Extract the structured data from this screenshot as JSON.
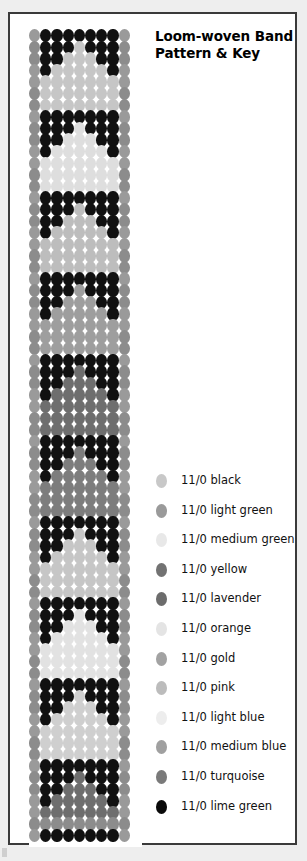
{
  "title": {
    "line1": "Loom-woven Band",
    "line2": "Pattern & Key"
  },
  "palette": {
    "black": "#111111",
    "light_green": "#8c8c8c",
    "medium_green": "#e2e2e2",
    "yellow": "#6e6e6e",
    "lavender": "#707070",
    "orange": "#dedede",
    "gold": "#9a9a9a",
    "pink": "#bdbdbd",
    "light_blue": "#e6e6e6",
    "medium_blue": "#9e9e9e",
    "turquoise": "#7d7d7d",
    "lime_green": "#080808"
  },
  "legend": {
    "entries": [
      {
        "label": "11/0 black",
        "swatch": "#c8c8c8"
      },
      {
        "label": "11/0 light green",
        "swatch": "#9a9a9a"
      },
      {
        "label": "11/0 medium green",
        "swatch": "#e8e8e8"
      },
      {
        "label": "11/0 yellow",
        "swatch": "#727272"
      },
      {
        "label": "11/0 lavender",
        "swatch": "#6c6c6c"
      },
      {
        "label": "11/0 orange",
        "swatch": "#e4e4e4"
      },
      {
        "label": "11/0 gold",
        "swatch": "#a2a2a2"
      },
      {
        "label": "11/0 pink",
        "swatch": "#bcbcbc"
      },
      {
        "label": "11/0 light blue",
        "swatch": "#ededed"
      },
      {
        "label": "11/0 medium blue",
        "swatch": "#a0a0a0"
      },
      {
        "label": "11/0 turquoise",
        "swatch": "#7a7a7a"
      },
      {
        "label": "11/0 lime green",
        "swatch": "#0a0a0a"
      }
    ]
  },
  "pattern": {
    "columns": 9,
    "rows": 70,
    "edge_color": "#9a9a9a",
    "motif_count": 10,
    "grid": [
      [
        "#9a9a9a",
        "#111111",
        "#111111",
        "#111111",
        "#111111",
        "#111111",
        "#111111",
        "#111111",
        "#9a9a9a"
      ],
      [
        "#8c8c8c",
        "#111111",
        "#111111",
        "#111111",
        "#c6c6c6",
        "#111111",
        "#111111",
        "#111111",
        "#8c8c8c"
      ],
      [
        "#8c8c8c",
        "#111111",
        "#111111",
        "#c6c6c6",
        "#c6c6c6",
        "#c6c6c6",
        "#111111",
        "#111111",
        "#8c8c8c"
      ],
      [
        "#9a9a9a",
        "#111111",
        "#c6c6c6",
        "#c6c6c6",
        "#c6c6c6",
        "#c6c6c6",
        "#c6c6c6",
        "#111111",
        "#9a9a9a"
      ],
      [
        "#9a9a9a",
        "#c6c6c6",
        "#c6c6c6",
        "#c6c6c6",
        "#c6c6c6",
        "#c6c6c6",
        "#c6c6c6",
        "#c6c6c6",
        "#9a9a9a"
      ],
      [
        "#8c8c8c",
        "#c6c6c6",
        "#c6c6c6",
        "#c6c6c6",
        "#c6c6c6",
        "#c6c6c6",
        "#c6c6c6",
        "#c6c6c6",
        "#8c8c8c"
      ],
      [
        "#8c8c8c",
        "#c6c6c6",
        "#c6c6c6",
        "#c6c6c6",
        "#c6c6c6",
        "#c6c6c6",
        "#c6c6c6",
        "#c6c6c6",
        "#8c8c8c"
      ],
      [
        "#9a9a9a",
        "#111111",
        "#111111",
        "#111111",
        "#111111",
        "#111111",
        "#111111",
        "#111111",
        "#9a9a9a"
      ],
      [
        "#8c8c8c",
        "#111111",
        "#111111",
        "#111111",
        "#dedede",
        "#111111",
        "#111111",
        "#111111",
        "#8c8c8c"
      ],
      [
        "#8c8c8c",
        "#111111",
        "#111111",
        "#dedede",
        "#dedede",
        "#dedede",
        "#111111",
        "#111111",
        "#8c8c8c"
      ],
      [
        "#9a9a9a",
        "#111111",
        "#dedede",
        "#dedede",
        "#dedede",
        "#dedede",
        "#dedede",
        "#111111",
        "#9a9a9a"
      ],
      [
        "#9a9a9a",
        "#dedede",
        "#dedede",
        "#dedede",
        "#dedede",
        "#dedede",
        "#dedede",
        "#dedede",
        "#9a9a9a"
      ],
      [
        "#8c8c8c",
        "#dedede",
        "#dedede",
        "#dedede",
        "#dedede",
        "#dedede",
        "#dedede",
        "#dedede",
        "#8c8c8c"
      ],
      [
        "#8c8c8c",
        "#dedede",
        "#dedede",
        "#dedede",
        "#dedede",
        "#dedede",
        "#dedede",
        "#dedede",
        "#8c8c8c"
      ],
      [
        "#9a9a9a",
        "#111111",
        "#111111",
        "#111111",
        "#111111",
        "#111111",
        "#111111",
        "#111111",
        "#9a9a9a"
      ],
      [
        "#8c8c8c",
        "#111111",
        "#111111",
        "#111111",
        "#bdbdbd",
        "#111111",
        "#111111",
        "#111111",
        "#8c8c8c"
      ],
      [
        "#8c8c8c",
        "#111111",
        "#111111",
        "#bdbdbd",
        "#bdbdbd",
        "#bdbdbd",
        "#111111",
        "#111111",
        "#8c8c8c"
      ],
      [
        "#9a9a9a",
        "#111111",
        "#bdbdbd",
        "#bdbdbd",
        "#bdbdbd",
        "#bdbdbd",
        "#bdbdbd",
        "#111111",
        "#9a9a9a"
      ],
      [
        "#9a9a9a",
        "#bdbdbd",
        "#bdbdbd",
        "#bdbdbd",
        "#bdbdbd",
        "#bdbdbd",
        "#bdbdbd",
        "#bdbdbd",
        "#9a9a9a"
      ],
      [
        "#8c8c8c",
        "#bdbdbd",
        "#bdbdbd",
        "#bdbdbd",
        "#bdbdbd",
        "#bdbdbd",
        "#bdbdbd",
        "#bdbdbd",
        "#8c8c8c"
      ],
      [
        "#8c8c8c",
        "#bdbdbd",
        "#bdbdbd",
        "#bdbdbd",
        "#bdbdbd",
        "#bdbdbd",
        "#bdbdbd",
        "#bdbdbd",
        "#8c8c8c"
      ],
      [
        "#9a9a9a",
        "#111111",
        "#111111",
        "#111111",
        "#111111",
        "#111111",
        "#111111",
        "#111111",
        "#9a9a9a"
      ],
      [
        "#8c8c8c",
        "#111111",
        "#111111",
        "#111111",
        "#9e9e9e",
        "#111111",
        "#111111",
        "#111111",
        "#8c8c8c"
      ],
      [
        "#8c8c8c",
        "#111111",
        "#111111",
        "#9e9e9e",
        "#9e9e9e",
        "#9e9e9e",
        "#111111",
        "#111111",
        "#8c8c8c"
      ],
      [
        "#9a9a9a",
        "#111111",
        "#9e9e9e",
        "#9e9e9e",
        "#9e9e9e",
        "#9e9e9e",
        "#9e9e9e",
        "#111111",
        "#9a9a9a"
      ],
      [
        "#9a9a9a",
        "#9e9e9e",
        "#9e9e9e",
        "#9e9e9e",
        "#9e9e9e",
        "#9e9e9e",
        "#9e9e9e",
        "#9e9e9e",
        "#9a9a9a"
      ],
      [
        "#8c8c8c",
        "#9e9e9e",
        "#9e9e9e",
        "#9e9e9e",
        "#9e9e9e",
        "#9e9e9e",
        "#9e9e9e",
        "#9e9e9e",
        "#8c8c8c"
      ],
      [
        "#8c8c8c",
        "#9e9e9e",
        "#9e9e9e",
        "#9e9e9e",
        "#9e9e9e",
        "#9e9e9e",
        "#9e9e9e",
        "#9e9e9e",
        "#8c8c8c"
      ],
      [
        "#9a9a9a",
        "#111111",
        "#111111",
        "#111111",
        "#111111",
        "#111111",
        "#111111",
        "#111111",
        "#9a9a9a"
      ],
      [
        "#8c8c8c",
        "#111111",
        "#111111",
        "#111111",
        "#6e6e6e",
        "#111111",
        "#111111",
        "#111111",
        "#8c8c8c"
      ],
      [
        "#8c8c8c",
        "#111111",
        "#111111",
        "#6e6e6e",
        "#6e6e6e",
        "#6e6e6e",
        "#111111",
        "#111111",
        "#8c8c8c"
      ],
      [
        "#9a9a9a",
        "#111111",
        "#6e6e6e",
        "#6e6e6e",
        "#6e6e6e",
        "#6e6e6e",
        "#6e6e6e",
        "#111111",
        "#9a9a9a"
      ],
      [
        "#9a9a9a",
        "#6e6e6e",
        "#6e6e6e",
        "#6e6e6e",
        "#6e6e6e",
        "#6e6e6e",
        "#6e6e6e",
        "#6e6e6e",
        "#9a9a9a"
      ],
      [
        "#8c8c8c",
        "#6e6e6e",
        "#6e6e6e",
        "#6e6e6e",
        "#6e6e6e",
        "#6e6e6e",
        "#6e6e6e",
        "#6e6e6e",
        "#8c8c8c"
      ],
      [
        "#8c8c8c",
        "#6e6e6e",
        "#6e6e6e",
        "#6e6e6e",
        "#6e6e6e",
        "#6e6e6e",
        "#6e6e6e",
        "#6e6e6e",
        "#8c8c8c"
      ],
      [
        "#9a9a9a",
        "#111111",
        "#111111",
        "#111111",
        "#111111",
        "#111111",
        "#111111",
        "#111111",
        "#9a9a9a"
      ],
      [
        "#8c8c8c",
        "#111111",
        "#111111",
        "#111111",
        "#7d7d7d",
        "#111111",
        "#111111",
        "#111111",
        "#8c8c8c"
      ],
      [
        "#8c8c8c",
        "#111111",
        "#111111",
        "#7d7d7d",
        "#7d7d7d",
        "#7d7d7d",
        "#111111",
        "#111111",
        "#8c8c8c"
      ],
      [
        "#9a9a9a",
        "#111111",
        "#7d7d7d",
        "#7d7d7d",
        "#7d7d7d",
        "#7d7d7d",
        "#7d7d7d",
        "#111111",
        "#9a9a9a"
      ],
      [
        "#9a9a9a",
        "#7d7d7d",
        "#7d7d7d",
        "#7d7d7d",
        "#7d7d7d",
        "#7d7d7d",
        "#7d7d7d",
        "#7d7d7d",
        "#9a9a9a"
      ],
      [
        "#8c8c8c",
        "#7d7d7d",
        "#7d7d7d",
        "#7d7d7d",
        "#7d7d7d",
        "#7d7d7d",
        "#7d7d7d",
        "#7d7d7d",
        "#8c8c8c"
      ],
      [
        "#8c8c8c",
        "#7d7d7d",
        "#7d7d7d",
        "#7d7d7d",
        "#7d7d7d",
        "#7d7d7d",
        "#7d7d7d",
        "#7d7d7d",
        "#8c8c8c"
      ],
      [
        "#9a9a9a",
        "#111111",
        "#111111",
        "#111111",
        "#111111",
        "#111111",
        "#111111",
        "#111111",
        "#9a9a9a"
      ],
      [
        "#8c8c8c",
        "#111111",
        "#111111",
        "#111111",
        "#c6c6c6",
        "#111111",
        "#111111",
        "#111111",
        "#8c8c8c"
      ],
      [
        "#8c8c8c",
        "#111111",
        "#111111",
        "#c6c6c6",
        "#c6c6c6",
        "#c6c6c6",
        "#111111",
        "#111111",
        "#8c8c8c"
      ],
      [
        "#9a9a9a",
        "#111111",
        "#c6c6c6",
        "#c6c6c6",
        "#c6c6c6",
        "#c6c6c6",
        "#c6c6c6",
        "#111111",
        "#9a9a9a"
      ],
      [
        "#9a9a9a",
        "#c6c6c6",
        "#c6c6c6",
        "#c6c6c6",
        "#c6c6c6",
        "#c6c6c6",
        "#c6c6c6",
        "#c6c6c6",
        "#9a9a9a"
      ],
      [
        "#8c8c8c",
        "#c6c6c6",
        "#c6c6c6",
        "#c6c6c6",
        "#c6c6c6",
        "#c6c6c6",
        "#c6c6c6",
        "#c6c6c6",
        "#8c8c8c"
      ],
      [
        "#8c8c8c",
        "#c6c6c6",
        "#c6c6c6",
        "#c6c6c6",
        "#c6c6c6",
        "#c6c6c6",
        "#c6c6c6",
        "#c6c6c6",
        "#8c8c8c"
      ],
      [
        "#9a9a9a",
        "#111111",
        "#111111",
        "#111111",
        "#111111",
        "#111111",
        "#111111",
        "#111111",
        "#9a9a9a"
      ],
      [
        "#8c8c8c",
        "#111111",
        "#111111",
        "#111111",
        "#e2e2e2",
        "#111111",
        "#111111",
        "#111111",
        "#8c8c8c"
      ],
      [
        "#8c8c8c",
        "#111111",
        "#111111",
        "#e2e2e2",
        "#e2e2e2",
        "#e2e2e2",
        "#111111",
        "#111111",
        "#8c8c8c"
      ],
      [
        "#9a9a9a",
        "#111111",
        "#e2e2e2",
        "#e2e2e2",
        "#e2e2e2",
        "#e2e2e2",
        "#e2e2e2",
        "#111111",
        "#9a9a9a"
      ],
      [
        "#9a9a9a",
        "#e2e2e2",
        "#e2e2e2",
        "#e2e2e2",
        "#e2e2e2",
        "#e2e2e2",
        "#e2e2e2",
        "#e2e2e2",
        "#9a9a9a"
      ],
      [
        "#8c8c8c",
        "#e2e2e2",
        "#e2e2e2",
        "#e2e2e2",
        "#e2e2e2",
        "#e2e2e2",
        "#e2e2e2",
        "#e2e2e2",
        "#8c8c8c"
      ],
      [
        "#8c8c8c",
        "#e2e2e2",
        "#e2e2e2",
        "#e2e2e2",
        "#e2e2e2",
        "#e2e2e2",
        "#e2e2e2",
        "#e2e2e2",
        "#8c8c8c"
      ],
      [
        "#9a9a9a",
        "#111111",
        "#111111",
        "#111111",
        "#111111",
        "#111111",
        "#111111",
        "#111111",
        "#9a9a9a"
      ],
      [
        "#8c8c8c",
        "#111111",
        "#111111",
        "#111111",
        "#cfcfcf",
        "#111111",
        "#111111",
        "#111111",
        "#8c8c8c"
      ],
      [
        "#8c8c8c",
        "#111111",
        "#111111",
        "#cfcfcf",
        "#cfcfcf",
        "#cfcfcf",
        "#111111",
        "#111111",
        "#8c8c8c"
      ],
      [
        "#9a9a9a",
        "#111111",
        "#cfcfcf",
        "#cfcfcf",
        "#cfcfcf",
        "#cfcfcf",
        "#cfcfcf",
        "#111111",
        "#9a9a9a"
      ],
      [
        "#9a9a9a",
        "#cfcfcf",
        "#cfcfcf",
        "#cfcfcf",
        "#cfcfcf",
        "#cfcfcf",
        "#cfcfcf",
        "#cfcfcf",
        "#9a9a9a"
      ],
      [
        "#8c8c8c",
        "#cfcfcf",
        "#cfcfcf",
        "#cfcfcf",
        "#cfcfcf",
        "#cfcfcf",
        "#cfcfcf",
        "#cfcfcf",
        "#8c8c8c"
      ],
      [
        "#8c8c8c",
        "#cfcfcf",
        "#cfcfcf",
        "#cfcfcf",
        "#cfcfcf",
        "#cfcfcf",
        "#cfcfcf",
        "#cfcfcf",
        "#8c8c8c"
      ],
      [
        "#9a9a9a",
        "#111111",
        "#111111",
        "#111111",
        "#111111",
        "#111111",
        "#111111",
        "#111111",
        "#9a9a9a"
      ],
      [
        "#8c8c8c",
        "#111111",
        "#111111",
        "#111111",
        "#6e6e6e",
        "#111111",
        "#111111",
        "#111111",
        "#8c8c8c"
      ],
      [
        "#8c8c8c",
        "#111111",
        "#111111",
        "#6e6e6e",
        "#6e6e6e",
        "#6e6e6e",
        "#111111",
        "#111111",
        "#8c8c8c"
      ],
      [
        "#9a9a9a",
        "#111111",
        "#6e6e6e",
        "#6e6e6e",
        "#6e6e6e",
        "#6e6e6e",
        "#6e6e6e",
        "#111111",
        "#9a9a9a"
      ],
      [
        "#9a9a9a",
        "#6e6e6e",
        "#6e6e6e",
        "#6e6e6e",
        "#6e6e6e",
        "#6e6e6e",
        "#6e6e6e",
        "#6e6e6e",
        "#9a9a9a"
      ],
      [
        "#8c8c8c",
        "#8c8c8c",
        "#8c8c8c",
        "#8c8c8c",
        "#8c8c8c",
        "#8c8c8c",
        "#8c8c8c",
        "#8c8c8c",
        "#8c8c8c"
      ],
      [
        "#9a9a9a",
        "#111111",
        "#111111",
        "#111111",
        "#111111",
        "#111111",
        "#111111",
        "#111111",
        "#9a9a9a"
      ]
    ]
  }
}
